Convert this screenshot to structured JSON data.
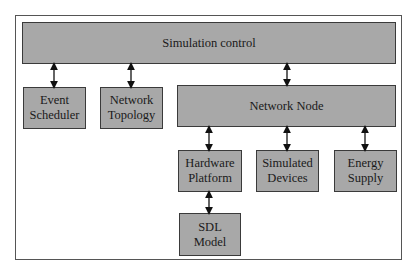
{
  "diagram": {
    "nodes": {
      "simulation_control": "Simulation control",
      "event_scheduler": [
        "Event",
        "Scheduler"
      ],
      "network_topology": [
        "Network",
        "Topology"
      ],
      "network_node": "Network Node",
      "hardware_platform": [
        "Hardware",
        "Platform"
      ],
      "simulated_devices": [
        "Simulated",
        "Devices"
      ],
      "energy_supply": [
        "Energy",
        "Supply"
      ],
      "sdl_model": [
        "SDL",
        "Model"
      ]
    },
    "edges": [
      {
        "from": "simulation_control",
        "to": "event_scheduler",
        "type": "bidirectional"
      },
      {
        "from": "simulation_control",
        "to": "network_topology",
        "type": "bidirectional"
      },
      {
        "from": "simulation_control",
        "to": "network_node",
        "type": "bidirectional"
      },
      {
        "from": "network_node",
        "to": "hardware_platform",
        "type": "bidirectional"
      },
      {
        "from": "network_node",
        "to": "simulated_devices",
        "type": "bidirectional"
      },
      {
        "from": "network_node",
        "to": "energy_supply",
        "type": "bidirectional"
      },
      {
        "from": "hardware_platform",
        "to": "sdl_model",
        "type": "bidirectional"
      }
    ],
    "colors": {
      "box_fill": "#a8a8a8",
      "box_border": "#3a3a3a",
      "frame": "#555555"
    }
  }
}
